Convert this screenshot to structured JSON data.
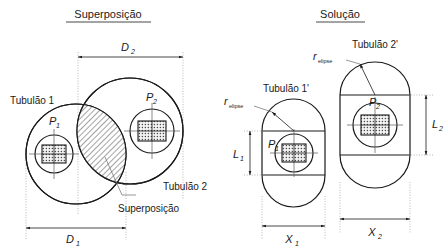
{
  "figure": {
    "panels": [
      {
        "key": "superposicao",
        "title": "Superposição",
        "shapes": [
          {
            "name": "Tubulão 1",
            "pressure": "P",
            "pressure_sub": "1",
            "diameter_label": "D",
            "diameter_sub": "1"
          },
          {
            "name": "Tubulão 2",
            "pressure": "P",
            "pressure_sub": "2",
            "diameter_label": "D",
            "diameter_sub": "2"
          }
        ],
        "annotations": [
          {
            "name": "overlap-callout",
            "label": "Superposição"
          }
        ]
      },
      {
        "key": "solucao",
        "title": "Solução",
        "shapes": [
          {
            "name": "Tubulão 1'",
            "pressure": "P",
            "pressure_sub": "1",
            "width_label": "X",
            "width_sub": "1",
            "height_label": "L",
            "height_sub": "1",
            "radius_label": "r",
            "radius_sub": "elipse"
          },
          {
            "name": "Tubulão 2'",
            "pressure": "P",
            "pressure_sub": "2",
            "width_label": "X",
            "width_sub": "2",
            "height_label": "L",
            "height_sub": "2",
            "radius_label": "r",
            "radius_sub": "elipse"
          }
        ]
      }
    ],
    "colors": {
      "fill": "#e0e0e0",
      "stroke": "#1a1a1a",
      "dimension": "#1a1a1a",
      "leader": "#6b6b6b",
      "background": "#ffffff"
    }
  }
}
